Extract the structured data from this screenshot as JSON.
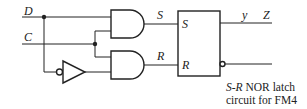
{
  "diagram": {
    "type": "logic-circuit",
    "inputs": [
      {
        "label": "D"
      },
      {
        "label": "C"
      }
    ],
    "gates": [
      {
        "id": "and-upper",
        "kind": "AND",
        "output_label": "S"
      },
      {
        "id": "and-lower",
        "kind": "AND",
        "output_label": "R"
      },
      {
        "id": "inverter",
        "kind": "NOT"
      }
    ],
    "latch": {
      "inputs": [
        "S",
        "R"
      ],
      "outputs": [
        {
          "label_var": "y",
          "label_out": "Z"
        },
        {
          "inverted": true
        }
      ]
    },
    "caption": {
      "line1_italic": "S-R",
      "line1_rest": " NOR latch",
      "line2": "circuit for FM4"
    }
  }
}
